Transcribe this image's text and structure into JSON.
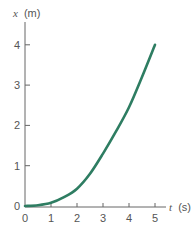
{
  "chart_data": {
    "type": "line",
    "title": "",
    "xlabel": "t (s)",
    "ylabel": "x (m)",
    "x_var": "t",
    "x_unit": "(s)",
    "y_var": "x",
    "y_unit": "(m)",
    "xlim": [
      0,
      5
    ],
    "ylim": [
      0,
      4
    ],
    "x_ticks": [
      "0",
      "1",
      "2",
      "3",
      "4",
      "5"
    ],
    "y_ticks": [
      "0",
      "1",
      "2",
      "3",
      "4"
    ],
    "grid": false,
    "legend": null,
    "series": [
      {
        "name": "x(t)",
        "color": "#2e7d62",
        "x": [
          0,
          0.5,
          1,
          1.5,
          2,
          2.5,
          3,
          3.5,
          4,
          4.5,
          5
        ],
        "values": [
          0,
          0.02,
          0.08,
          0.22,
          0.43,
          0.8,
          1.3,
          1.85,
          2.45,
          3.2,
          4.0
        ]
      }
    ]
  }
}
